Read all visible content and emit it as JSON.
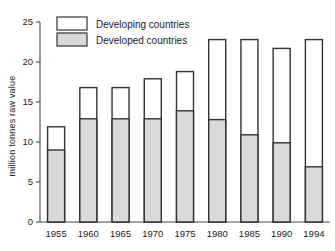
{
  "chart_data": {
    "type": "bar",
    "subtype": "stacked",
    "title": "",
    "xlabel": "",
    "ylabel": "million tonnes raw value",
    "categories": [
      "1955",
      "1960",
      "1965",
      "1970",
      "1975",
      "1980",
      "1985",
      "1990",
      "1994"
    ],
    "series": [
      {
        "name": "Developed countries",
        "color": "#d9d9d9",
        "values": [
          9.0,
          12.9,
          12.9,
          12.9,
          13.9,
          12.8,
          10.9,
          9.9,
          6.9
        ]
      },
      {
        "name": "Developing countries",
        "color": "#ffffff",
        "values": [
          2.9,
          3.9,
          3.9,
          5.0,
          4.9,
          10.0,
          11.9,
          11.8,
          15.9
        ]
      }
    ],
    "totals": [
      11.9,
      16.8,
      16.8,
      17.9,
      18.8,
      22.8,
      22.8,
      21.7,
      22.8
    ],
    "ylim": [
      0,
      25
    ],
    "yticks": [
      0,
      5,
      10,
      15,
      20,
      25
    ],
    "ytick_labels": [
      "0",
      "5",
      "10",
      "15",
      "20",
      "25"
    ],
    "grid": false,
    "legend_position": "top-left",
    "legend": [
      {
        "label": "Developing countries",
        "fill": "#ffffff"
      },
      {
        "label": "Developed countries",
        "fill": "#d9d9d9"
      }
    ]
  }
}
